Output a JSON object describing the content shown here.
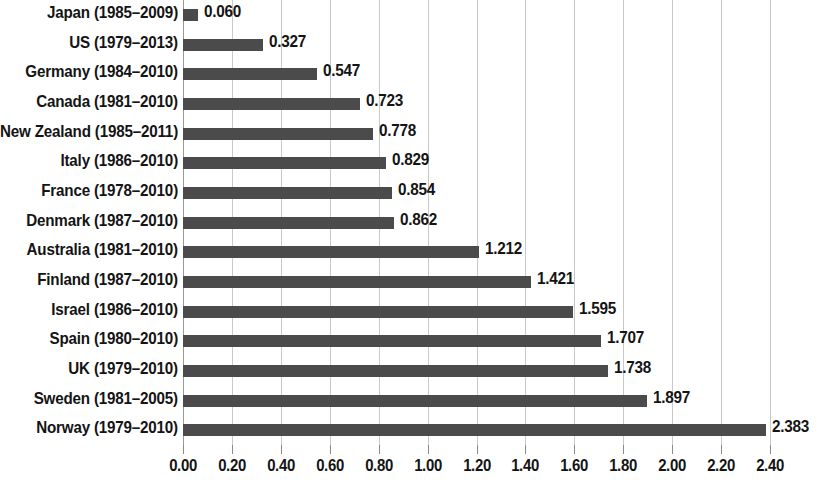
{
  "chart_data": {
    "type": "bar",
    "orientation": "horizontal",
    "title": "",
    "subtitle": "",
    "xlabel": "",
    "ylabel": "",
    "xlim": [
      0.0,
      2.4
    ],
    "grid": true,
    "legend": null,
    "categories": [
      "Japan (1985–2009)",
      "US (1979–2013)",
      "Germany (1984–2010)",
      "Canada (1981–2010)",
      "New Zealand (1985–2011)",
      "Italy (1986–2010)",
      "France (1978–2010)",
      "Denmark (1987–2010)",
      "Australia (1981–2010)",
      "Finland (1987–2010)",
      "Israel (1986–2010)",
      "Spain (1980–2010)",
      "UK (1979–2010)",
      "Sweden (1981–2005)",
      "Norway (1979–2010)"
    ],
    "values": [
      0.06,
      0.327,
      0.547,
      0.723,
      0.778,
      0.829,
      0.854,
      0.862,
      1.212,
      1.421,
      1.595,
      1.707,
      1.738,
      1.897,
      2.383
    ],
    "value_labels": [
      "0.060",
      "0.327",
      "0.547",
      "0.723",
      "0.778",
      "0.829",
      "0.854",
      "0.862",
      "1.212",
      "1.421",
      "1.595",
      "1.707",
      "1.738",
      "1.897",
      "2.383"
    ],
    "xticks": [
      0.0,
      0.2,
      0.4,
      0.6,
      0.8,
      1.0,
      1.2,
      1.4,
      1.6,
      1.8,
      2.0,
      2.2,
      2.4
    ],
    "xtick_labels": [
      "0.00",
      "0.20",
      "0.40",
      "0.60",
      "0.80",
      "1.00",
      "1.20",
      "1.40",
      "1.60",
      "1.80",
      "2.00",
      "2.20",
      "2.40"
    ],
    "colors": {
      "bar": "#4b4b4b",
      "gridline": "#c9c9c9",
      "axis": "#9a9a9a",
      "text": "#141414",
      "background": "#ffffff"
    }
  }
}
